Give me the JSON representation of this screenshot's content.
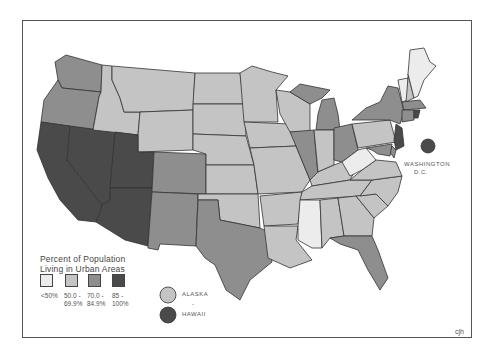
{
  "map": {
    "title": "Percent of Population Living in Urban Areas",
    "title_lines": [
      "Percent of Population",
      "Living in Urban Areas"
    ],
    "credit": "cjh",
    "categories": [
      {
        "id": "c1",
        "label_lines": [
          "<50%",
          ""
        ],
        "color": "#ececec"
      },
      {
        "id": "c2",
        "label_lines": [
          "50.0 -",
          "69.9%"
        ],
        "color": "#c4c4c4"
      },
      {
        "id": "c3",
        "label_lines": [
          "70.0 -",
          "84.9%"
        ],
        "color": "#8e8e8e"
      },
      {
        "id": "c4",
        "label_lines": [
          "85 -",
          "100%"
        ],
        "color": "#4a4a4a"
      }
    ],
    "insets": {
      "alaska": {
        "label": "ALASKA",
        "category": "c2"
      },
      "separator": "-",
      "hawaii": {
        "label": "HAWAII",
        "category": "c4"
      },
      "dc": {
        "label_lines": [
          "WASHINGTON",
          "D.C."
        ],
        "category": "c4"
      }
    },
    "states": {
      "WA": "c3",
      "OR": "c3",
      "CA": "c4",
      "NV": "c4",
      "AZ": "c4",
      "ID": "c2",
      "MT": "c2",
      "WY": "c2",
      "UT": "c4",
      "CO": "c3",
      "NM": "c3",
      "ND": "c2",
      "SD": "c2",
      "NE": "c2",
      "KS": "c2",
      "OK": "c2",
      "TX": "c3",
      "MN": "c2",
      "IA": "c2",
      "MO": "c2",
      "AR": "c2",
      "LA": "c2",
      "WI": "c2",
      "IL": "c3",
      "MI": "c3",
      "IN": "c2",
      "OH": "c3",
      "KY": "c2",
      "TN": "c2",
      "MS": "c1",
      "AL": "c2",
      "GA": "c2",
      "FL": "c3",
      "SC": "c2",
      "NC": "c2",
      "VA": "c2",
      "WV": "c1",
      "PA": "c2",
      "NY": "c3",
      "VT": "c1",
      "NH": "c2",
      "ME": "c1",
      "MA": "c3",
      "RI": "c4",
      "CT": "c3",
      "NJ": "c4",
      "DE": "c3",
      "MD": "c3"
    }
  }
}
